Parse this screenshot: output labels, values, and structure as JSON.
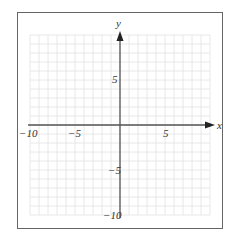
{
  "figure": {
    "type": "coordinate-grid",
    "x_axis": {
      "label": "x",
      "range": [
        -10,
        10
      ],
      "tick_labels": [
        {
          "value": -10,
          "text": "−10"
        },
        {
          "value": -5,
          "text": "−5"
        },
        {
          "value": 5,
          "text": "5"
        }
      ]
    },
    "y_axis": {
      "label": "y",
      "range": [
        -10,
        10
      ],
      "tick_labels": [
        {
          "value": 5,
          "text": "5"
        },
        {
          "value": -5,
          "text": "−5"
        },
        {
          "value": -10,
          "text": "−10"
        }
      ]
    },
    "grid": {
      "step": 1,
      "color": "#e2e2e2"
    },
    "axis_color": "#555555",
    "frame_color": "#666666"
  }
}
